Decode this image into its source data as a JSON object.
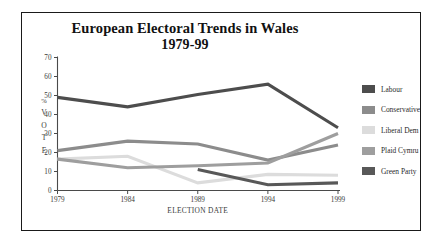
{
  "figure": {
    "title_line1": "European Electoral Trends in Wales",
    "title_line2": "1979-99"
  },
  "chart_data": {
    "type": "line",
    "title": "European Electoral Trends in Wales 1979-99",
    "xlabel": "ELECTION DATE",
    "ylabel": "% VOTE",
    "ylabel_chars": [
      "%",
      "V",
      "O",
      "T",
      "E"
    ],
    "categories": [
      "1979",
      "1984",
      "1989",
      "1994",
      "1999"
    ],
    "x": [
      1979,
      1984,
      1989,
      1994,
      1999
    ],
    "ylim": [
      0,
      70
    ],
    "yticks": [
      0,
      10,
      20,
      30,
      40,
      50,
      60,
      70
    ],
    "xlim": [
      1979,
      1999
    ],
    "grid": false,
    "legend_position": "right",
    "series": [
      {
        "name": "Labour",
        "color": "#4d4d4d",
        "values": [
          49,
          44,
          50.5,
          56,
          33
        ]
      },
      {
        "name": "Conservative",
        "color": "#8c8c8c",
        "values": [
          21,
          26,
          24.5,
          16,
          24
        ]
      },
      {
        "name": "Liberal Dem",
        "color": "#dcdcdc",
        "values": [
          16.5,
          18,
          4,
          8.5,
          8
        ]
      },
      {
        "name": "Plaid Cymru",
        "color": "#9e9e9e",
        "values": [
          16.5,
          12,
          13,
          14.5,
          30
        ]
      },
      {
        "name": "Green Party",
        "color": "#585858",
        "values": [
          null,
          null,
          11,
          3,
          4
        ]
      }
    ]
  },
  "legend": {
    "items": [
      {
        "label": "Labour",
        "color": "#4d4d4d"
      },
      {
        "label": "Conservative",
        "color": "#8c8c8c"
      },
      {
        "label": "Liberal Dem",
        "color": "#dcdcdc"
      },
      {
        "label": "Plaid Cymru",
        "color": "#9e9e9e"
      },
      {
        "label": "Green Party",
        "color": "#585858"
      }
    ]
  }
}
